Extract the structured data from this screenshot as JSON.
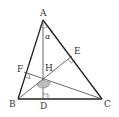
{
  "diagram": {
    "points": {
      "A": {
        "label": "A",
        "x": 43,
        "y": 20
      },
      "B": {
        "label": "B",
        "x": 18,
        "y": 99
      },
      "C": {
        "label": "C",
        "x": 102,
        "y": 99
      },
      "D": {
        "label": "D",
        "x": 43,
        "y": 99
      },
      "E": {
        "label": "E",
        "x": 72,
        "y": 56
      },
      "F": {
        "label": "F",
        "x": 24,
        "y": 72
      },
      "H": {
        "label": "H",
        "x": 43,
        "y": 80
      }
    },
    "angle_label": "α",
    "angle_superscript": "°",
    "right_angle_marks": [
      "D",
      "E",
      "F"
    ],
    "shaded_angle_at": "H",
    "colors": {
      "line": "#222222",
      "text": "#333333",
      "shade": "#bdbdbd"
    }
  }
}
